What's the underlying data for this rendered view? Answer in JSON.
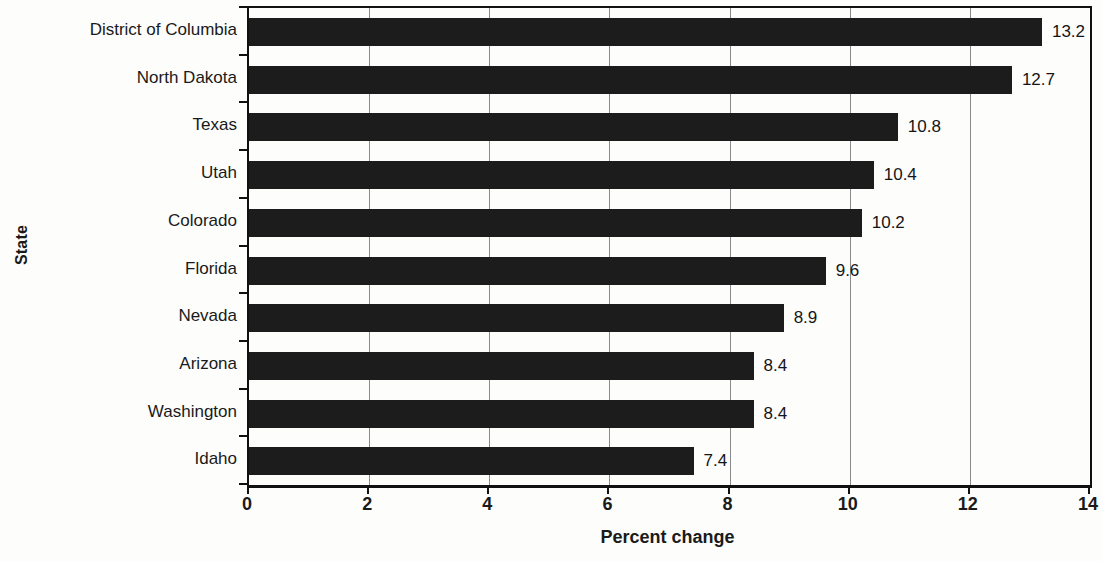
{
  "chart_data": {
    "type": "bar",
    "orientation": "horizontal",
    "title": "",
    "xlabel": "Percent change",
    "ylabel": "State",
    "categories": [
      "District of Columbia",
      "North Dakota",
      "Texas",
      "Utah",
      "Colorado",
      "Florida",
      "Nevada",
      "Arizona",
      "Washington",
      "Idaho"
    ],
    "values": [
      13.2,
      12.7,
      10.8,
      10.4,
      10.2,
      9.6,
      8.9,
      8.4,
      8.4,
      7.4
    ],
    "value_labels": [
      "13.2",
      "12.7",
      "10.8",
      "10.4",
      "10.2",
      "9.6",
      "8.9",
      "8.4",
      "8.4",
      "7.4"
    ],
    "xlim": [
      0,
      14
    ],
    "xticks": [
      0,
      2,
      4,
      6,
      8,
      10,
      12,
      14
    ],
    "xtick_labels": [
      "0",
      "2",
      "4",
      "6",
      "8",
      "10",
      "12",
      "14"
    ],
    "grid": "vertical",
    "legend": "none",
    "bar_color": "#1c1c1c",
    "grid_color": "#8a8a8a",
    "axis_color": "#111111",
    "background_color": "#fdfdfc"
  }
}
